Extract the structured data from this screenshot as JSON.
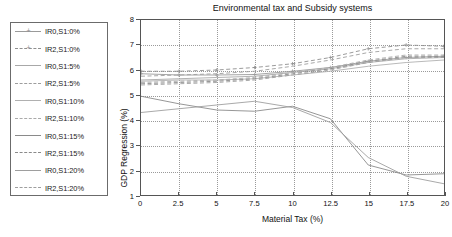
{
  "chart_data": {
    "type": "line",
    "title": "Environmental tax and Subsidy systems",
    "xlabel": "Material Tax (%)",
    "ylabel": "GDP Regression (%)",
    "xlim": [
      0,
      20
    ],
    "ylim": [
      1,
      8
    ],
    "xticks": [
      "0",
      "2.5",
      "5",
      "7.5",
      "10",
      "12.5",
      "15",
      "17.5",
      "20"
    ],
    "yticks": [
      "1",
      "2",
      "3",
      "4",
      "5",
      "6",
      "7",
      "8"
    ],
    "grid": true,
    "legend_position": "outside-left",
    "x": [
      0,
      2.5,
      5,
      7.5,
      10,
      12.5,
      15,
      17.5,
      20
    ],
    "series": [
      {
        "name": "IR0,S1:0%",
        "style": "solid",
        "marker": "plus",
        "color": "#9a9a9a",
        "values": [
          5.85,
          5.8,
          5.8,
          5.82,
          5.95,
          6.1,
          6.35,
          6.5,
          6.55
        ]
      },
      {
        "name": "IR2,S1:0%",
        "style": "dashed",
        "marker": "plus",
        "color": "#8f8f8f",
        "values": [
          5.95,
          5.95,
          6.0,
          6.1,
          6.25,
          6.5,
          6.85,
          7.0,
          6.95
        ]
      },
      {
        "name": "IR0,S1:5%",
        "style": "solid",
        "marker": "none",
        "color": "#a8a8a8",
        "values": [
          5.6,
          5.65,
          5.7,
          5.75,
          5.9,
          6.05,
          6.3,
          6.45,
          6.5
        ]
      },
      {
        "name": "IR2,S1:5%",
        "style": "dashed",
        "marker": "none",
        "color": "#9d9d9d",
        "values": [
          5.75,
          5.8,
          5.85,
          5.95,
          6.15,
          6.4,
          6.7,
          6.85,
          6.85
        ]
      },
      {
        "name": "IR0,S1:10%",
        "style": "solid",
        "marker": "none",
        "color": "#b0b0b0",
        "values": [
          5.55,
          5.6,
          5.6,
          5.65,
          5.8,
          5.95,
          6.15,
          6.3,
          6.4
        ]
      },
      {
        "name": "IR2,S1:10%",
        "style": "dashed",
        "marker": "none",
        "color": "#aaaaaa",
        "values": [
          5.5,
          5.55,
          5.6,
          5.7,
          5.9,
          6.1,
          6.4,
          6.6,
          6.6
        ]
      },
      {
        "name": "IR0,S1:15%",
        "style": "solid",
        "marker": "none",
        "color": "#8a8a8a",
        "values": [
          4.95,
          4.65,
          4.4,
          4.35,
          4.55,
          4.05,
          2.2,
          1.8,
          1.85
        ]
      },
      {
        "name": "IR2,S1:15%",
        "style": "dashed",
        "marker": "none",
        "color": "#8a8a8a",
        "values": [
          5.45,
          5.5,
          5.55,
          5.65,
          5.85,
          6.05,
          6.35,
          6.55,
          6.55
        ]
      },
      {
        "name": "IR0,S1:20%",
        "style": "solid",
        "marker": "none",
        "color": "#9e9e9e",
        "values": [
          4.3,
          4.45,
          4.6,
          4.75,
          4.5,
          3.9,
          2.5,
          1.75,
          1.45
        ]
      },
      {
        "name": "IR2,S1:20%",
        "style": "dashed",
        "marker": "none",
        "color": "#9e9e9e",
        "values": [
          5.4,
          5.45,
          5.5,
          5.6,
          5.8,
          6.0,
          6.3,
          6.5,
          6.5
        ]
      }
    ]
  },
  "legend": {
    "items": [
      {
        "label": "IR0,S1:0%"
      },
      {
        "label": "IR2,S1:0%"
      },
      {
        "label": "IR0,S1:5%"
      },
      {
        "label": "IR2,S1:5%"
      },
      {
        "label": "IR0,S1:10%"
      },
      {
        "label": "IR2,S1:10%"
      },
      {
        "label": "IR0,S1:15%"
      },
      {
        "label": "IR2,S1:15%"
      },
      {
        "label": "IR0,S1:20%"
      },
      {
        "label": "IR2,S1:20%"
      }
    ],
    "marker_glyph": "+"
  }
}
